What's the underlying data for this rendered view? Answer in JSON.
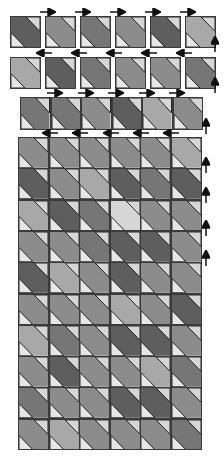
{
  "diagram": {
    "type": "quilt-assembly-diagram",
    "block_motif": "diagonal band (top-left to bottom-right) with light corner triangles",
    "colors": {
      "light": "#d6d6d6",
      "lightest": "#e6e6e6",
      "medium_light": "#a8a8a8",
      "medium": "#8c8c8c",
      "medium_dark": "#767676",
      "dark": "#5e5e5e",
      "outline": "#3a3a3a",
      "arrow": "#111111"
    },
    "separate_rows": [
      {
        "name": "row-1",
        "x": 10,
        "y": 16,
        "block_w": 31,
        "block_h": 32,
        "gap": 4,
        "bands": [
          "dark",
          "medium",
          "medium_dark",
          "medium",
          "dark",
          "medium_light"
        ],
        "arrows": {
          "direction": "right",
          "y": 12,
          "xs": [
            40,
            75,
            110,
            145,
            180
          ]
        },
        "side_arrow": {
          "direction": "up",
          "x": 215,
          "y": 44
        }
      },
      {
        "name": "row-2",
        "x": 10,
        "y": 57,
        "block_w": 31,
        "block_h": 32,
        "gap": 4,
        "bands": [
          "medium_light",
          "dark",
          "medium_dark",
          "medium",
          "medium",
          "medium_dark"
        ],
        "arrows": {
          "direction": "left",
          "y": 53,
          "xs": [
            36,
            71,
            106,
            141,
            176
          ]
        },
        "side_arrow": {
          "direction": "up",
          "x": 215,
          "y": 85
        }
      },
      {
        "name": "row-3",
        "x": 20,
        "y": 97,
        "block_w": 30.5,
        "block_h": 33,
        "gap": 0,
        "bands": [
          "medium_dark",
          "medium_dark",
          "medium",
          "dark",
          "medium_light",
          "medium"
        ],
        "arrows": {
          "direction": "right",
          "y": 93,
          "xs": [
            47,
            78,
            108,
            139,
            169
          ]
        },
        "side_arrow": {
          "direction": "up",
          "x": 206,
          "y": 126
        }
      }
    ],
    "assembled_grid": {
      "x": 18,
      "y": 137,
      "cols": 6,
      "rows": 10,
      "block_w": 30.5,
      "block_h": 31.3,
      "top_arrows": {
        "direction": "left",
        "y": 133,
        "xs": [
          42,
          72,
          103,
          133,
          163
        ]
      },
      "side_arrows": {
        "direction": "up",
        "x": 206,
        "ys": [
          165,
          195,
          228,
          258
        ]
      },
      "bands": [
        [
          "medium",
          "medium",
          "medium",
          "medium",
          "medium",
          "medium_light"
        ],
        [
          "dark",
          "medium",
          "medium_light",
          "dark",
          "medium_dark",
          "dark"
        ],
        [
          "medium_light",
          "dark",
          "medium_dark",
          "light",
          "medium",
          "medium"
        ],
        [
          "medium",
          "medium",
          "medium_dark",
          "dark",
          "dark",
          "medium"
        ],
        [
          "dark",
          "medium_light",
          "medium",
          "dark",
          "medium",
          "medium"
        ],
        [
          "medium",
          "medium",
          "medium",
          "medium_light",
          "medium",
          "dark"
        ],
        [
          "medium_light",
          "medium_dark",
          "medium",
          "dark",
          "dark",
          "medium"
        ],
        [
          "medium",
          "dark",
          "medium",
          "medium",
          "medium_light",
          "medium_dark"
        ],
        [
          "medium_dark",
          "medium",
          "medium",
          "dark",
          "dark",
          "medium"
        ],
        [
          "medium",
          "medium_light",
          "medium",
          "medium",
          "medium",
          "medium_dark"
        ]
      ]
    }
  }
}
